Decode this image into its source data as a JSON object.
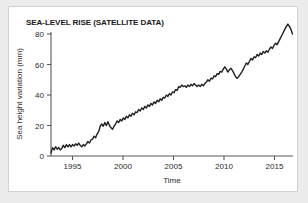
{
  "figure": {
    "title": "SEA-LEVEL RISE (SATELLITE DATA)",
    "panel_background": "#ffffff",
    "page_background": "#ececed",
    "border_color": "#d2d2d4"
  },
  "chart_data": {
    "type": "line",
    "title": "SEA-LEVEL RISE (SATELLITE DATA)",
    "xlabel": "Time",
    "ylabel": "Sea height variation (mm)",
    "xlim": [
      1993.0,
      2016.6
    ],
    "ylim": [
      -2,
      88
    ],
    "xticks": [
      1995,
      2000,
      2005,
      2010,
      2015
    ],
    "xtick_labels": [
      "1995",
      "2000",
      "2005",
      "2010",
      "2015"
    ],
    "yticks": [
      0,
      20,
      40,
      60,
      80
    ],
    "ytick_labels": [
      "0",
      "20",
      "40",
      "60",
      "80"
    ],
    "grid": false,
    "legend": false,
    "line_color": "#231f20",
    "line_width": 1.4,
    "series": [
      {
        "name": "Sea height variation",
        "units": "mm",
        "x": [
          1993.0,
          1993.15,
          1993.3,
          1993.45,
          1993.6,
          1993.75,
          1993.9,
          1994.05,
          1994.2,
          1994.35,
          1994.5,
          1994.65,
          1994.8,
          1994.95,
          1995.1,
          1995.25,
          1995.4,
          1995.55,
          1995.7,
          1995.85,
          1996.0,
          1996.15,
          1996.3,
          1996.45,
          1996.6,
          1996.75,
          1996.9,
          1997.05,
          1997.2,
          1997.35,
          1997.5,
          1997.65,
          1997.8,
          1997.95,
          1998.1,
          1998.25,
          1998.4,
          1998.55,
          1998.7,
          1998.85,
          1999.0,
          1999.15,
          1999.3,
          1999.45,
          1999.6,
          1999.75,
          1999.9,
          2000.05,
          2000.2,
          2000.35,
          2000.5,
          2000.65,
          2000.8,
          2000.95,
          2001.1,
          2001.25,
          2001.4,
          2001.55,
          2001.7,
          2001.85,
          2002.0,
          2002.15,
          2002.3,
          2002.45,
          2002.6,
          2002.75,
          2002.9,
          2003.05,
          2003.2,
          2003.35,
          2003.5,
          2003.65,
          2003.8,
          2003.95,
          2004.1,
          2004.25,
          2004.4,
          2004.55,
          2004.7,
          2004.85,
          2005.0,
          2005.15,
          2005.3,
          2005.45,
          2005.6,
          2005.75,
          2005.9,
          2006.05,
          2006.2,
          2006.35,
          2006.5,
          2006.65,
          2006.8,
          2006.95,
          2007.1,
          2007.25,
          2007.4,
          2007.55,
          2007.7,
          2007.85,
          2008.0,
          2008.15,
          2008.3,
          2008.45,
          2008.6,
          2008.75,
          2008.9,
          2009.05,
          2009.2,
          2009.35,
          2009.5,
          2009.65,
          2009.8,
          2009.95,
          2010.1,
          2010.25,
          2010.4,
          2010.55,
          2010.7,
          2010.85,
          2011.0,
          2011.15,
          2011.3,
          2011.45,
          2011.6,
          2011.75,
          2011.9,
          2012.05,
          2012.2,
          2012.35,
          2012.5,
          2012.65,
          2012.8,
          2012.95,
          2013.1,
          2013.25,
          2013.4,
          2013.55,
          2013.7,
          2013.85,
          2014.0,
          2014.15,
          2014.3,
          2014.45,
          2014.6,
          2014.75,
          2014.9,
          2015.05,
          2015.2,
          2015.35,
          2015.5,
          2015.65,
          2015.8,
          2015.95,
          2016.1,
          2016.25,
          2016.4,
          2016.55
        ],
        "y": [
          2.0,
          5.5,
          4.0,
          6.0,
          4.5,
          5.5,
          4.0,
          5.0,
          7.0,
          5.5,
          7.5,
          6.0,
          7.5,
          6.0,
          7.5,
          6.5,
          8.0,
          7.0,
          8.5,
          7.0,
          6.0,
          7.5,
          6.5,
          8.0,
          9.5,
          8.5,
          10.5,
          11.0,
          13.0,
          12.0,
          14.5,
          16.0,
          19.5,
          21.0,
          19.5,
          22.0,
          20.0,
          22.5,
          20.0,
          18.5,
          17.5,
          19.5,
          21.0,
          23.0,
          22.0,
          24.0,
          23.0,
          25.0,
          24.0,
          26.0,
          25.0,
          27.0,
          26.0,
          28.0,
          27.0,
          29.0,
          28.5,
          30.5,
          29.5,
          31.5,
          30.5,
          32.5,
          31.5,
          33.5,
          32.5,
          34.5,
          33.5,
          35.5,
          34.5,
          36.5,
          35.5,
          37.5,
          36.5,
          38.5,
          38.0,
          40.0,
          39.0,
          41.0,
          40.0,
          42.0,
          41.5,
          43.5,
          43.0,
          45.5,
          45.0,
          46.5,
          45.5,
          46.0,
          45.0,
          46.5,
          45.5,
          47.0,
          46.0,
          47.5,
          46.5,
          45.5,
          46.5,
          45.5,
          47.0,
          46.0,
          47.5,
          48.5,
          50.0,
          49.0,
          51.0,
          50.5,
          52.5,
          52.0,
          54.0,
          53.5,
          55.5,
          55.0,
          57.0,
          58.5,
          57.0,
          55.0,
          56.5,
          57.5,
          56.0,
          54.0,
          52.0,
          51.0,
          52.0,
          53.5,
          55.0,
          57.0,
          59.0,
          61.0,
          60.0,
          62.0,
          64.0,
          63.0,
          65.0,
          64.5,
          66.5,
          65.5,
          67.5,
          66.5,
          68.5,
          67.5,
          69.0,
          68.0,
          70.0,
          71.5,
          70.5,
          72.5,
          74.0,
          73.0,
          75.0,
          77.0,
          79.0,
          81.0,
          83.0,
          85.0,
          86.5,
          85.0,
          83.0,
          80.0
        ]
      }
    ]
  },
  "axes": {
    "ylabel": "Sea height variation (mm)",
    "xlabel": "Time",
    "axis_color": "#58585a"
  }
}
